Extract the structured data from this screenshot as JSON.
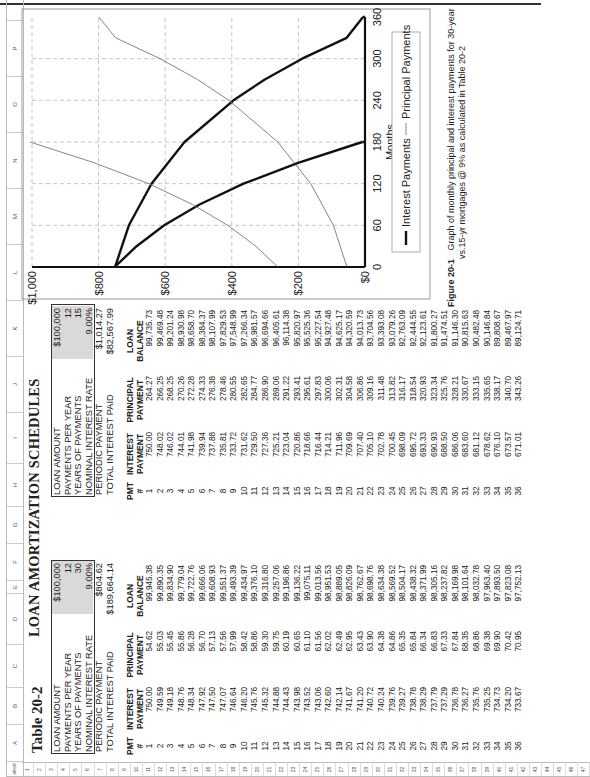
{
  "sheet": {
    "corner_label": "amort",
    "columns": [
      "A",
      "B",
      "C",
      "D",
      "E",
      "F",
      "G",
      "H",
      "I",
      "J",
      "K",
      "L",
      "M",
      "N",
      "O",
      "P",
      "Q",
      "R"
    ],
    "rows": [
      "1",
      "2",
      "3",
      "4",
      "5",
      "6",
      "7",
      "8",
      "9",
      "10",
      "11",
      "12",
      "13",
      "14",
      "15",
      "16",
      "17",
      "18",
      "19",
      "20",
      "21",
      "22",
      "23",
      "24",
      "25",
      "26",
      "27",
      "28",
      "29",
      "30",
      "31",
      "32",
      "33",
      "34",
      "35",
      "36",
      "37",
      "38",
      "39",
      "40",
      "41",
      "42",
      "43",
      "44",
      "45",
      "46",
      "47"
    ]
  },
  "table_label": "Table 20-2",
  "title": "LOAN AMORTIZATION SCHEDULES",
  "title_part1": "LOAN AM",
  "title_part2": "ORTIZATION SCHEDULES",
  "loan30": {
    "labels": [
      "LOAN AMOUNT",
      "PAYMENTS PER YEAR",
      "YEARS OF PAYMENTS",
      "NOMINAL INTEREST RATE",
      "PERIODIC PAYMENT",
      "TOTAL INTEREST PAID"
    ],
    "values": [
      "$100,000",
      "12",
      "30",
      "9.00%",
      "$804.62",
      "$189,664.14"
    ],
    "headers": {
      "pmt": [
        "PMT",
        "#"
      ],
      "interest": [
        "INTEREST",
        "PAYMENT"
      ],
      "principal": [
        "PRINCIPAL",
        "PAYMENT"
      ],
      "balance": [
        "LOAN",
        "BALANCE"
      ]
    },
    "rows": [
      [
        "1",
        "750.00",
        "54.62",
        "99,945.38"
      ],
      [
        "2",
        "749.59",
        "55.03",
        "99,890.35"
      ],
      [
        "3",
        "749.18",
        "55.45",
        "99,834.90"
      ],
      [
        "4",
        "748.76",
        "55.86",
        "99,779.04"
      ],
      [
        "5",
        "748.34",
        "56.28",
        "99,722.76"
      ],
      [
        "6",
        "747.92",
        "56.70",
        "99,666.06"
      ],
      [
        "7",
        "747.50",
        "57.13",
        "99,608.93"
      ],
      [
        "8",
        "747.07",
        "57.56",
        "99,551.37"
      ],
      [
        "9",
        "746.64",
        "57.99",
        "99,493.39"
      ],
      [
        "10",
        "746.20",
        "58.42",
        "99,434.97"
      ],
      [
        "11",
        "745.76",
        "58.86",
        "99,376.10"
      ],
      [
        "12",
        "745.32",
        "59.30",
        "99,316.80"
      ],
      [
        "13",
        "744.88",
        "59.75",
        "99,257.06"
      ],
      [
        "14",
        "744.43",
        "60.19",
        "99,196.86"
      ],
      [
        "15",
        "743.98",
        "60.65",
        "99,136.22"
      ],
      [
        "16",
        "743.52",
        "61.10",
        "99,075.11"
      ],
      [
        "17",
        "743.06",
        "61.56",
        "99,013.56"
      ],
      [
        "18",
        "742.60",
        "62.02",
        "98,951.53"
      ],
      [
        "19",
        "742.14",
        "62.49",
        "98,889.05"
      ],
      [
        "20",
        "741.67",
        "62.95",
        "98,826.09"
      ],
      [
        "21",
        "741.20",
        "63.43",
        "98,762.67"
      ],
      [
        "22",
        "740.72",
        "63.90",
        "98,698.76"
      ],
      [
        "23",
        "740.24",
        "64.38",
        "98,634.38"
      ],
      [
        "24",
        "739.76",
        "64.86",
        "98,569.52"
      ],
      [
        "25",
        "739.27",
        "65.35",
        "98,504.17"
      ],
      [
        "26",
        "738.78",
        "65.84",
        "98,438.32"
      ],
      [
        "27",
        "738.29",
        "66.34",
        "98,371.99"
      ],
      [
        "28",
        "737.79",
        "66.83",
        "98,305.16"
      ],
      [
        "29",
        "737.29",
        "67.33",
        "98,237.82"
      ],
      [
        "30",
        "736.78",
        "67.84",
        "98,169.98"
      ],
      [
        "31",
        "736.27",
        "68.35",
        "98,101.64"
      ],
      [
        "32",
        "735.76",
        "68.86",
        "98,032.78"
      ],
      [
        "33",
        "735.25",
        "69.38",
        "97,963.40"
      ],
      [
        "34",
        "734.73",
        "69.90",
        "97,893.50"
      ],
      [
        "35",
        "734.20",
        "70.42",
        "97,823.08"
      ],
      [
        "36",
        "733.67",
        "70.95",
        "97,752.13"
      ]
    ]
  },
  "loan15": {
    "labels": [
      "LOAN AMOUNT",
      "PAYMENTS PER YEAR",
      "YEARS OF PAYMENTS",
      "NOMINAL INTEREST RATE",
      "PERIODIC PAYMENT",
      "TOTAL INTEREST PAID"
    ],
    "values": [
      "$100,000",
      "12",
      "15",
      "9.00%",
      "$1,014.27",
      "$82,567.99"
    ],
    "headers": {
      "pmt": [
        "PMT",
        "#"
      ],
      "interest": [
        "INTEREST",
        "PAYMENT"
      ],
      "principal": [
        "PRINCIPAL",
        "PAYMENT"
      ],
      "balance": [
        "LOAN",
        "BALANCE"
      ]
    },
    "rows": [
      [
        "1",
        "750.00",
        "264.27",
        "99,735.73"
      ],
      [
        "2",
        "748.02",
        "266.25",
        "99,469.48"
      ],
      [
        "3",
        "746.02",
        "268.25",
        "99,201.24"
      ],
      [
        "4",
        "744.01",
        "270.26",
        "98,930.98"
      ],
      [
        "5",
        "741.98",
        "272.28",
        "98,658.70"
      ],
      [
        "6",
        "739.94",
        "274.33",
        "98,384.37"
      ],
      [
        "7",
        "737.88",
        "276.38",
        "98,107.99"
      ],
      [
        "8",
        "735.81",
        "278.46",
        "97,829.53"
      ],
      [
        "9",
        "733.72",
        "280.55",
        "97,548.99"
      ],
      [
        "10",
        "731.62",
        "282.65",
        "97,266.34"
      ],
      [
        "11",
        "729.50",
        "284.77",
        "96,981.57"
      ],
      [
        "12",
        "727.36",
        "286.90",
        "96,694.66"
      ],
      [
        "13",
        "725.21",
        "289.06",
        "96,405.61"
      ],
      [
        "14",
        "723.04",
        "291.22",
        "96,114.38"
      ],
      [
        "15",
        "720.86",
        "293.41",
        "95,820.97"
      ],
      [
        "16",
        "718.66",
        "295.61",
        "95,525.36"
      ],
      [
        "17",
        "716.44",
        "297.83",
        "95,227.54"
      ],
      [
        "18",
        "714.21",
        "300.06",
        "94,927.48"
      ],
      [
        "19",
        "711.96",
        "302.31",
        "94,625.17"
      ],
      [
        "20",
        "709.69",
        "304.58",
        "94,320.59"
      ],
      [
        "21",
        "707.40",
        "306.86",
        "94,013.73"
      ],
      [
        "22",
        "705.10",
        "309.16",
        "93,704.56"
      ],
      [
        "23",
        "702.78",
        "311.48",
        "93,393.08"
      ],
      [
        "24",
        "700.45",
        "313.82",
        "93,079.26"
      ],
      [
        "25",
        "698.09",
        "316.17",
        "92,763.09"
      ],
      [
        "26",
        "695.72",
        "318.54",
        "92,444.55"
      ],
      [
        "27",
        "693.33",
        "320.93",
        "92,123.61"
      ],
      [
        "28",
        "690.93",
        "323.34",
        "91,800.27"
      ],
      [
        "29",
        "688.50",
        "325.76",
        "91,474.51"
      ],
      [
        "30",
        "686.06",
        "328.21",
        "91,146.30"
      ],
      [
        "31",
        "683.60",
        "330.67",
        "90,815.63"
      ],
      [
        "32",
        "681.12",
        "333.15",
        "90,482.48"
      ],
      [
        "33",
        "678.62",
        "335.65",
        "90,146.84"
      ],
      [
        "34",
        "676.10",
        "338.17",
        "89,808.67"
      ],
      [
        "35",
        "673.57",
        "340.70",
        "89,467.97"
      ],
      [
        "36",
        "671.01",
        "343.26",
        "89,124.71"
      ]
    ]
  },
  "chart_data": {
    "type": "line",
    "title": "",
    "xlabel": "Months",
    "ylabel": "",
    "x_ticks": [
      "0",
      "60",
      "120",
      "180",
      "240",
      "300",
      "360"
    ],
    "y_ticks": [
      "$0",
      "$200",
      "$400",
      "$600",
      "$800",
      "$1,000"
    ],
    "xlim": [
      0,
      360
    ],
    "ylim": [
      0,
      1000
    ],
    "grid": true,
    "legend": [
      "Interest Payments",
      "Principal Payments"
    ],
    "legend_position": "bottom",
    "series": [
      {
        "name": "Interest Payments (30-yr)",
        "style": "thick",
        "x": [
          1,
          60,
          120,
          180,
          240,
          270,
          300,
          330,
          360
        ],
        "values": [
          750,
          709,
          641,
          542,
          395,
          301,
          189,
          55,
          6
        ]
      },
      {
        "name": "Principal Payments (30-yr)",
        "style": "thin",
        "x": [
          1,
          60,
          120,
          180,
          240,
          270,
          300,
          330,
          360
        ],
        "values": [
          55,
          95,
          163,
          262,
          409,
          503,
          615,
          749,
          799
        ]
      },
      {
        "name": "Interest Payments (15-yr)",
        "style": "thick",
        "x": [
          1,
          30,
          60,
          90,
          120,
          150,
          180
        ],
        "values": [
          750,
          686,
          603,
          497,
          365,
          201,
          8
        ]
      },
      {
        "name": "Principal Payments (15-yr)",
        "style": "thin",
        "x": [
          1,
          30,
          60,
          90,
          120,
          150,
          180
        ],
        "values": [
          264,
          328,
          412,
          518,
          649,
          813,
          1006
        ]
      }
    ]
  },
  "chart_labels": {
    "y_ticks": [
      "$1,000",
      "$800",
      "$600",
      "$400",
      "$200",
      "$0"
    ],
    "x_ticks": [
      "0",
      "60",
      "120",
      "180",
      "240",
      "300",
      "360"
    ],
    "xlabel": "Months",
    "legend_interest": "Interest Payments",
    "legend_principal": "Principal Payments"
  },
  "caption": {
    "label": "Figure 20-1",
    "line1": "Graph of monthly principal and interest payments for 30-year",
    "line2": "vs.15-yr mortgages @ 9% as calculated in Table 20-2"
  }
}
